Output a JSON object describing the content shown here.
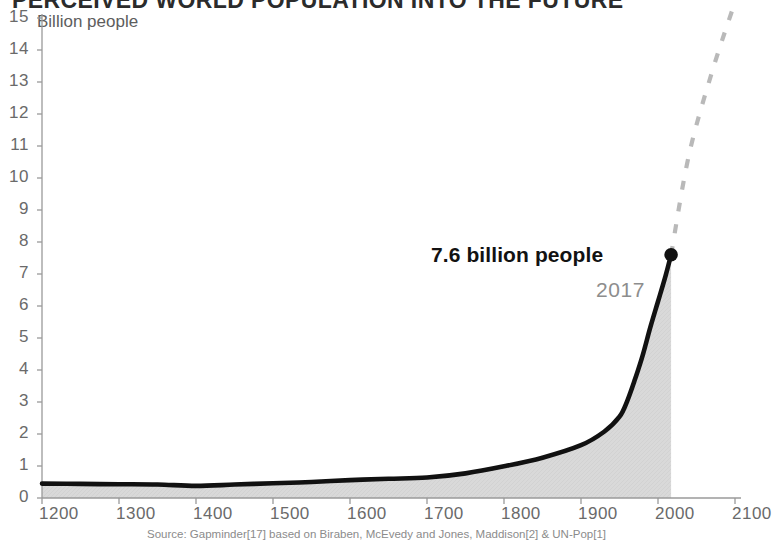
{
  "title": "PERCEIVED WORLD POPULATION INTO THE FUTURE",
  "y_axis_caption": "Billion people",
  "source_note": "Source: Gapminder[17] based on Biraben, McEvedy and Jones, Maddison[2] & UN-Pop[1]",
  "annotation": {
    "value_label": "7.6 billion people",
    "year_label": "2017"
  },
  "colors": {
    "line": "#111111",
    "area_fill": "#d8d8d8",
    "projection": "#b9b9b9",
    "axis": "#9a9a9a",
    "tick_text": "#6a6a6a",
    "title": "#2b2b2b",
    "source_text": "#8b8b8b",
    "background": "#ffffff"
  },
  "chart_data": {
    "type": "area",
    "title": "PERCEIVED WORLD POPULATION INTO THE FUTURE",
    "xlabel": "",
    "ylabel": "Billion people",
    "xlim": [
      1200,
      2100
    ],
    "ylim": [
      0,
      15
    ],
    "grid": false,
    "legend": "none",
    "x_ticks": [
      1200,
      1300,
      1400,
      1500,
      1600,
      1700,
      1800,
      1900,
      2000,
      2100
    ],
    "y_ticks": [
      0,
      1,
      2,
      3,
      4,
      5,
      6,
      7,
      8,
      9,
      10,
      11,
      12,
      13,
      14,
      15
    ],
    "series": [
      {
        "name": "World population (historical)",
        "style": "solid-black-with-gray-area-fill",
        "x": [
          1200,
          1250,
          1300,
          1350,
          1400,
          1450,
          1500,
          1550,
          1600,
          1650,
          1700,
          1750,
          1800,
          1850,
          1900,
          1930,
          1950,
          1960,
          1970,
          1980,
          1990,
          2000,
          2010,
          2017
        ],
        "y": [
          0.45,
          0.44,
          0.43,
          0.42,
          0.38,
          0.42,
          0.46,
          0.5,
          0.56,
          0.6,
          0.64,
          0.77,
          0.99,
          1.26,
          1.65,
          2.07,
          2.54,
          3.03,
          3.7,
          4.45,
          5.33,
          6.14,
          6.96,
          7.6
        ]
      },
      {
        "name": "Projection",
        "style": "dashed-gray",
        "x": [
          2017,
          2040,
          2070,
          2100
        ],
        "y": [
          7.6,
          10.7,
          13.3,
          15.5
        ]
      }
    ],
    "annotations": [
      {
        "x": 2017,
        "y": 7.6,
        "text": "7.6 billion people",
        "sub": "2017",
        "marker": "dot"
      }
    ]
  },
  "y_tick_labels": [
    "15",
    "14",
    "13",
    "12",
    "11",
    "10",
    "9",
    "8",
    "7",
    "6",
    "5",
    "4",
    "3",
    "2",
    "1",
    "0"
  ],
  "x_tick_labels": [
    "1200",
    "1300",
    "1400",
    "1500",
    "1600",
    "1700",
    "1800",
    "1900",
    "2000",
    "2100"
  ]
}
